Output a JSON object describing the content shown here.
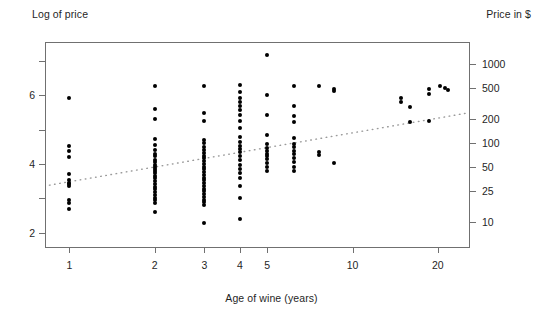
{
  "chart_data": {
    "type": "scatter",
    "title": "",
    "xlabel": "Age of wine (years)",
    "ylabel": "Log of price",
    "ylabel_right": "Price in $",
    "x_scale": "log",
    "y_scale": "linear",
    "xlim": [
      0.82,
      26.0
    ],
    "ylim": [
      1.55,
      7.55
    ],
    "grid": false,
    "legend": null,
    "x_ticks": [
      {
        "value": 1,
        "label": "1"
      },
      {
        "value": 2,
        "label": "2"
      },
      {
        "value": 3,
        "label": "3"
      },
      {
        "value": 4,
        "label": "4"
      },
      {
        "value": 5,
        "label": "5"
      },
      {
        "value": 10,
        "label": "10"
      },
      {
        "value": 20,
        "label": "20"
      }
    ],
    "y_ticks_left": [
      {
        "value": 2,
        "label": "2"
      },
      {
        "value": 3,
        "label": ""
      },
      {
        "value": 4,
        "label": "4"
      },
      {
        "value": 5,
        "label": ""
      },
      {
        "value": 6,
        "label": "6"
      },
      {
        "value": 7,
        "label": ""
      }
    ],
    "y_ticks_right": [
      {
        "value": 6.908,
        "label": "1000"
      },
      {
        "value": 6.215,
        "label": "500"
      },
      {
        "value": 5.298,
        "label": "200"
      },
      {
        "value": 4.605,
        "label": "100"
      },
      {
        "value": 3.912,
        "label": "50"
      },
      {
        "value": 3.219,
        "label": "25"
      },
      {
        "value": 2.303,
        "label": "10"
      }
    ],
    "series": [
      {
        "name": "wines",
        "marker": "filled-circle",
        "color": "#000000",
        "points": [
          [
            1,
            5.93
          ],
          [
            1,
            4.52
          ],
          [
            1,
            4.38
          ],
          [
            1,
            4.2
          ],
          [
            1,
            3.72
          ],
          [
            1,
            3.52
          ],
          [
            1,
            3.45
          ],
          [
            1,
            3.4
          ],
          [
            1,
            3.35
          ],
          [
            1,
            2.95
          ],
          [
            1,
            2.85
          ],
          [
            1,
            2.68
          ],
          [
            2,
            6.26
          ],
          [
            2,
            5.6
          ],
          [
            2,
            5.32
          ],
          [
            2,
            4.72
          ],
          [
            2,
            4.56
          ],
          [
            2,
            4.4
          ],
          [
            2,
            4.3
          ],
          [
            2,
            4.22
          ],
          [
            2,
            4.12
          ],
          [
            2,
            4.05
          ],
          [
            2,
            3.98
          ],
          [
            2,
            3.92
          ],
          [
            2,
            3.86
          ],
          [
            2,
            3.8
          ],
          [
            2,
            3.74
          ],
          [
            2,
            3.66
          ],
          [
            2,
            3.58
          ],
          [
            2,
            3.5
          ],
          [
            2,
            3.42
          ],
          [
            2,
            3.34
          ],
          [
            2,
            3.26
          ],
          [
            2,
            3.18
          ],
          [
            2,
            3.1
          ],
          [
            2,
            3.02
          ],
          [
            2,
            2.94
          ],
          [
            2,
            2.86
          ],
          [
            2,
            2.6
          ],
          [
            3,
            6.28
          ],
          [
            3,
            5.48
          ],
          [
            3,
            5.26
          ],
          [
            3,
            4.7
          ],
          [
            3,
            4.6
          ],
          [
            3,
            4.48
          ],
          [
            3,
            4.4
          ],
          [
            3,
            4.32
          ],
          [
            3,
            4.24
          ],
          [
            3,
            4.16
          ],
          [
            3,
            4.08
          ],
          [
            3,
            4.0
          ],
          [
            3,
            3.92
          ],
          [
            3,
            3.84
          ],
          [
            3,
            3.76
          ],
          [
            3,
            3.68
          ],
          [
            3,
            3.6
          ],
          [
            3,
            3.52
          ],
          [
            3,
            3.44
          ],
          [
            3,
            3.36
          ],
          [
            3,
            3.28
          ],
          [
            3,
            3.2
          ],
          [
            3,
            3.12
          ],
          [
            3,
            3.04
          ],
          [
            3,
            2.96
          ],
          [
            3,
            2.88
          ],
          [
            3,
            2.8
          ],
          [
            3,
            2.28
          ],
          [
            4,
            6.3
          ],
          [
            4,
            6.08
          ],
          [
            4,
            5.92
          ],
          [
            4,
            5.8
          ],
          [
            4,
            5.68
          ],
          [
            4,
            5.56
          ],
          [
            4,
            5.42
          ],
          [
            4,
            5.24
          ],
          [
            4,
            5.05
          ],
          [
            4,
            4.78
          ],
          [
            4,
            4.64
          ],
          [
            4,
            4.52
          ],
          [
            4,
            4.44
          ],
          [
            4,
            4.36
          ],
          [
            4,
            4.22
          ],
          [
            4,
            4.1
          ],
          [
            4,
            3.98
          ],
          [
            4,
            3.86
          ],
          [
            4,
            3.74
          ],
          [
            4,
            3.58
          ],
          [
            4,
            3.36
          ],
          [
            4,
            3.02
          ],
          [
            4,
            2.4
          ],
          [
            5,
            7.18
          ],
          [
            5,
            6.02
          ],
          [
            5,
            5.42
          ],
          [
            5,
            4.84
          ],
          [
            5,
            4.58
          ],
          [
            5,
            4.46
          ],
          [
            5,
            4.38
          ],
          [
            5,
            4.3
          ],
          [
            5,
            4.22
          ],
          [
            5,
            4.14
          ],
          [
            5,
            4.04
          ],
          [
            5,
            3.92
          ],
          [
            5,
            3.8
          ],
          [
            6.2,
            6.26
          ],
          [
            6.2,
            5.68
          ],
          [
            6.2,
            5.4
          ],
          [
            6.2,
            5.22
          ],
          [
            6.2,
            4.74
          ],
          [
            6.2,
            4.58
          ],
          [
            6.2,
            4.48
          ],
          [
            6.2,
            4.38
          ],
          [
            6.2,
            4.3
          ],
          [
            6.2,
            4.18
          ],
          [
            6.2,
            4.06
          ],
          [
            6.2,
            3.92
          ],
          [
            6.2,
            3.8
          ],
          [
            7.6,
            6.28
          ],
          [
            7.6,
            4.34
          ],
          [
            7.6,
            4.26
          ],
          [
            8.6,
            6.18
          ],
          [
            8.6,
            6.12
          ],
          [
            8.6,
            4.04
          ],
          [
            14.8,
            5.92
          ],
          [
            14.8,
            5.8
          ],
          [
            16.0,
            5.66
          ],
          [
            16.0,
            5.22
          ],
          [
            18.6,
            6.18
          ],
          [
            18.6,
            6.04
          ],
          [
            18.6,
            5.24
          ],
          [
            20.4,
            6.28
          ],
          [
            21.3,
            6.2
          ],
          [
            21.8,
            6.16
          ]
        ]
      }
    ],
    "fit_line": {
      "name": "least-squares fit",
      "style": "dotted",
      "color": "#9a9a9a",
      "endpoints": [
        [
          0.85,
          3.38
        ],
        [
          25.0,
          5.47
        ]
      ]
    }
  }
}
